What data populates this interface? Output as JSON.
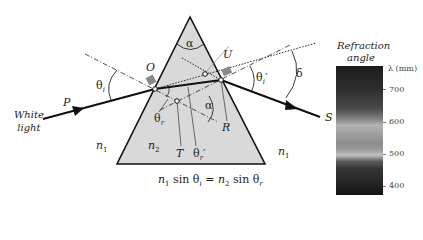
{
  "labels": {
    "alpha_top": "α",
    "alpha_inner": "α",
    "O": "O",
    "U": "U",
    "P": "P",
    "R": "R",
    "S": "S",
    "T": "T",
    "theta_i": "θ",
    "theta_i_sub": "i",
    "theta_i_prime": "θ",
    "theta_i_prime_sub": "i",
    "theta_i_prime_mark": "′",
    "theta_r": "θ",
    "theta_r_sub": "r",
    "theta_r_prime": "θ",
    "theta_r_prime_sub": "r",
    "theta_r_prime_mark": "′",
    "delta": "δ",
    "white_light_1": "White",
    "white_light_2": "light",
    "n1_left": "n",
    "n1_left_sub": "1",
    "n2": "n",
    "n2_sub": "2",
    "n1_right": "n",
    "n1_right_sub": "1"
  },
  "equation": {
    "n1": "n",
    "n1_sub": "1",
    "sin1": " sin θ",
    "theta_i_sub": "i",
    "equals": " = ",
    "n2": "n",
    "n2_sub": "2",
    "sin2": " sin θ",
    "theta_r_sub": "r"
  },
  "spectrum": {
    "title_1": "Refraction",
    "title_2": "angle",
    "unit": "λ (mm)",
    "ticks": [
      "700",
      "600",
      "500",
      "400"
    ]
  },
  "colors": {
    "prism_fill": "#d9d9d9",
    "ray": "#111111",
    "marker": "#8a8a8a"
  }
}
